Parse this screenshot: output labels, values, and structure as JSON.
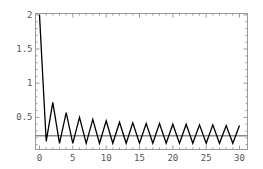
{
  "chart_data": {
    "type": "line",
    "title": "",
    "xlabel": "",
    "ylabel": "",
    "xlim": [
      -0.6,
      31.2
    ],
    "ylim": [
      0.03,
      2.02
    ],
    "grid": false,
    "legend": null,
    "x_ticks": [
      0,
      5,
      10,
      15,
      20,
      25,
      30
    ],
    "y_ticks": [
      0.5,
      1,
      1.5,
      2
    ],
    "x_tick_labels": [
      "0",
      "5",
      "10",
      "15",
      "20",
      "25",
      "30"
    ],
    "y_tick_labels": [
      "0.5",
      "1",
      "1.5",
      "2"
    ],
    "series": [
      {
        "name": "sequence",
        "color": "#000000",
        "x": [
          0,
          1,
          2,
          3,
          4,
          5,
          6,
          7,
          8,
          9,
          10,
          11,
          12,
          13,
          14,
          15,
          16,
          17,
          18,
          19,
          20,
          21,
          22,
          23,
          24,
          25,
          26,
          27,
          28,
          29,
          30
        ],
        "values": [
          2.0,
          0.15,
          0.72,
          0.12,
          0.57,
          0.12,
          0.5,
          0.12,
          0.47,
          0.12,
          0.45,
          0.12,
          0.43,
          0.12,
          0.42,
          0.12,
          0.41,
          0.12,
          0.41,
          0.12,
          0.4,
          0.12,
          0.4,
          0.12,
          0.39,
          0.12,
          0.39,
          0.12,
          0.38,
          0.12,
          0.38
        ]
      },
      {
        "name": "reference-line",
        "color": "#555555",
        "type": "hline",
        "y": 0.23
      }
    ]
  }
}
